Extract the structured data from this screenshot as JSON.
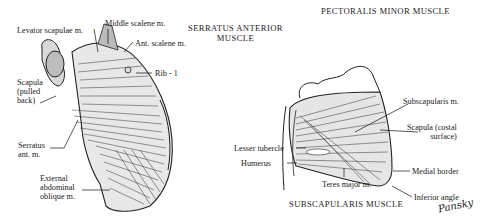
{
  "titles": {
    "serratus": [
      "SERRATUS ANTERIOR",
      "MUSCLE"
    ],
    "pectoralis": "PECTORALIS MINOR MUSCLE",
    "subscapularis": "SUBSCAPULARIS MUSCLE"
  },
  "left_labels": {
    "levator": "Levator scapulae m.",
    "middle_scalene": "Middle scalene m.",
    "ant_scalene": "Ant. scalene m.",
    "rib1": "Rib - 1",
    "scapula": [
      "Scapula",
      "(pulled",
      "back)"
    ],
    "serratus": [
      "Serratus",
      "ant. m."
    ],
    "ext_oblique": [
      "External",
      "abdominal",
      "oblique m."
    ]
  },
  "right_labels": {
    "subscapularis": "Subscapularis m.",
    "scapula_costal": [
      "Scapula (costal",
      "surface)"
    ],
    "lesser_tubercle": "Lesser tubercle",
    "humerus": "Humerus",
    "medial_border": "Medial border",
    "teres_major": "Teres major m.",
    "inferior_angle": "Inferior angle"
  },
  "signature": "Pansky"
}
